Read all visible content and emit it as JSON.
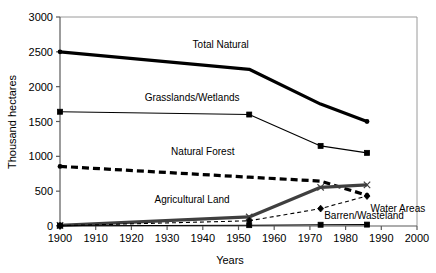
{
  "chart_data": {
    "type": "line",
    "title": "",
    "xlabel": "Years",
    "ylabel": "Thousand hectares",
    "xlim": [
      1900,
      2000
    ],
    "ylim": [
      0,
      3000
    ],
    "xticks": [
      1900,
      1910,
      1920,
      1930,
      1940,
      1950,
      1960,
      1970,
      1980,
      1990,
      2000
    ],
    "yticks": [
      0,
      500,
      1000,
      1500,
      2000,
      2500,
      3000
    ],
    "grid": false,
    "legend_position": "inline-annotations",
    "x": [
      1900,
      1953,
      1973,
      1986
    ],
    "series": [
      {
        "name": "Total Natural",
        "values": [
          2500,
          2250,
          1750,
          1500
        ],
        "style": "solid",
        "thickness": "thick",
        "color": "#000000",
        "marker": "none",
        "label_x": 1945,
        "label_y": 2560
      },
      {
        "name": "Grasslands/Wetlands",
        "values": [
          1640,
          1600,
          1150,
          1050
        ],
        "style": "solid",
        "thickness": "thin",
        "color": "#000000",
        "marker": "square",
        "label_x": 1937,
        "label_y": 1790
      },
      {
        "name": "Natural Forest",
        "values": [
          855,
          700,
          645,
          440
        ],
        "style": "dashed",
        "thickness": "thick",
        "color": "#000000",
        "marker": "none",
        "label_x": 1940,
        "label_y": 1020
      },
      {
        "name": "Agricultural Land",
        "values": [
          10,
          130,
          555,
          590
        ],
        "style": "solid",
        "thickness": "thick",
        "color": "#3f3f3f",
        "marker": "cross",
        "label_x": 1937,
        "label_y": 330
      },
      {
        "name": "Water Areas",
        "values": [
          5,
          75,
          250,
          430
        ],
        "style": "dashed",
        "thickness": "thin",
        "color": "#000000",
        "marker": "diamond",
        "label_x": 1987,
        "label_y": 205
      },
      {
        "name": "Barren/Wasteland",
        "values": [
          5,
          12,
          18,
          20
        ],
        "style": "solid",
        "thickness": "thin",
        "color": "#000000",
        "marker": "square",
        "label_x": 1974,
        "label_y": 95
      }
    ]
  }
}
